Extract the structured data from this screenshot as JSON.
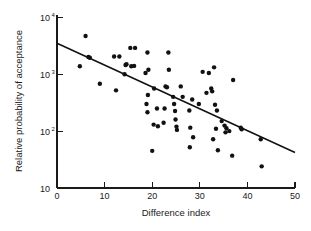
{
  "chart_data": {
    "type": "scatter",
    "title": "",
    "xlabel": "Difference index",
    "ylabel": "Relative probability of acceptance",
    "xlim": [
      0,
      50
    ],
    "ylim": [
      10,
      10000
    ],
    "yscale": "log",
    "xscale": "linear",
    "grid": false,
    "legend": null,
    "xticks": [
      0,
      10,
      20,
      30,
      40,
      50
    ],
    "xtick_labels": [
      "0",
      "10",
      "20",
      "30",
      "40",
      "50"
    ],
    "yticks": [
      10,
      100,
      1000,
      10000
    ],
    "ytick_labels": [
      "10",
      "10²",
      "10³",
      "10⁴"
    ],
    "ytick_label_parts": [
      {
        "base": "10",
        "exp": ""
      },
      {
        "base": "10",
        "exp": "2"
      },
      {
        "base": "10",
        "exp": "3"
      },
      {
        "base": "10",
        "exp": "4"
      }
    ],
    "marker": "filled-circle",
    "marker_color": "#111111",
    "marker_size": 2.2,
    "series": [
      {
        "name": "observations",
        "points": [
          [
            6.0,
            4700
          ],
          [
            4.8,
            1380
          ],
          [
            6.6,
            2000
          ],
          [
            6.9,
            1950
          ],
          [
            9.0,
            680
          ],
          [
            12.0,
            2050
          ],
          [
            13.1,
            2050
          ],
          [
            14.2,
            1000
          ],
          [
            14.4,
            1450
          ],
          [
            14.6,
            1500
          ],
          [
            12.4,
            520
          ],
          [
            15.6,
            1380
          ],
          [
            16.2,
            1400
          ],
          [
            15.4,
            2900
          ],
          [
            16.4,
            2900
          ],
          [
            19.0,
            2400
          ],
          [
            18.6,
            1050
          ],
          [
            19.2,
            1200
          ],
          [
            19.1,
            430
          ],
          [
            18.8,
            300
          ],
          [
            19.0,
            215
          ],
          [
            20.3,
            130
          ],
          [
            21.2,
            122
          ],
          [
            20.4,
            560
          ],
          [
            21.0,
            250
          ],
          [
            22.8,
            610
          ],
          [
            23.1,
            590
          ],
          [
            22.6,
            250
          ],
          [
            23.4,
            2400
          ],
          [
            23.5,
            1200
          ],
          [
            20.0,
            45
          ],
          [
            22.4,
            140
          ],
          [
            24.4,
            400
          ],
          [
            24.6,
            300
          ],
          [
            24.8,
            225
          ],
          [
            24.9,
            160
          ],
          [
            25.1,
            120
          ],
          [
            25.2,
            105
          ],
          [
            26.4,
            400
          ],
          [
            26.0,
            610
          ],
          [
            27.8,
            230
          ],
          [
            28.4,
            360
          ],
          [
            28.0,
            115
          ],
          [
            28.6,
            78
          ],
          [
            27.9,
            52
          ],
          [
            29.8,
            300
          ],
          [
            30.6,
            1100
          ],
          [
            31.9,
            1050
          ],
          [
            31.4,
            470
          ],
          [
            32.4,
            560
          ],
          [
            32.6,
            500
          ],
          [
            33.0,
            1320
          ],
          [
            33.2,
            290
          ],
          [
            33.6,
            230
          ],
          [
            33.4,
            110
          ],
          [
            32.8,
            72
          ],
          [
            33.8,
            46
          ],
          [
            34.6,
            150
          ],
          [
            35.2,
            125
          ],
          [
            35.6,
            112
          ],
          [
            35.4,
            95
          ],
          [
            36.2,
            100
          ],
          [
            37.0,
            790
          ],
          [
            36.8,
            37
          ],
          [
            38.6,
            115
          ],
          [
            38.8,
            108
          ],
          [
            42.8,
            72
          ],
          [
            43.0,
            24
          ]
        ]
      }
    ],
    "fit_line": {
      "name": "regression",
      "x_start": 0,
      "y_start": 3500,
      "x_end": 50,
      "y_end": 42,
      "color": "#111111"
    }
  }
}
